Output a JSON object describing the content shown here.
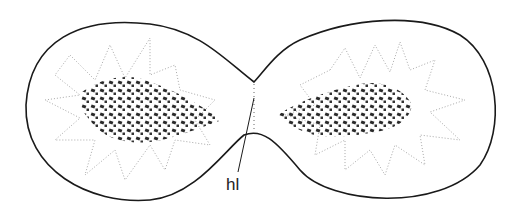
{
  "diagram": {
    "labels": [
      {
        "id": "hl",
        "text": "hl",
        "x": 226,
        "y": 190
      }
    ],
    "colors": {
      "outline": "#1a1a1a",
      "chromatin": "#2a2a2a",
      "stipple": "#9a9a9a",
      "background": "#ffffff"
    }
  }
}
